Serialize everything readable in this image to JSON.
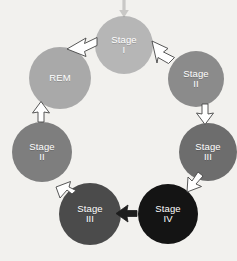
{
  "figure": {
    "name": "sleep-cycle-diagram",
    "background_color": "#f2f1ee",
    "label_color": "#ffffff",
    "arrow_fill": "#ffffff",
    "arrow_stroke": "#3c3c3c"
  },
  "nodes": [
    {
      "id": "stage-1",
      "title": "Stage",
      "numeral": "I",
      "color": "#b6b6b6",
      "cx": 124,
      "cy": 45,
      "r": 29
    },
    {
      "id": "stage-2-right",
      "title": "Stage",
      "numeral": "II",
      "color": "#8b8b8b",
      "cx": 196,
      "cy": 79,
      "r": 28
    },
    {
      "id": "stage-3-right",
      "title": "Stage",
      "numeral": "III",
      "color": "#6d6d6d",
      "cx": 208,
      "cy": 152,
      "r": 29
    },
    {
      "id": "stage-4",
      "title": "Stage",
      "numeral": "IV",
      "color": "#141414",
      "cx": 168,
      "cy": 214,
      "r": 30
    },
    {
      "id": "stage-3-bottom",
      "title": "Stage",
      "numeral": "III",
      "color": "#4b4b4b",
      "cx": 90,
      "cy": 214,
      "r": 31
    },
    {
      "id": "stage-2-left",
      "title": "Stage",
      "numeral": "II",
      "color": "#7e7e7e",
      "cx": 42,
      "cy": 152,
      "r": 30
    },
    {
      "id": "rem",
      "title": "REM",
      "numeral": "",
      "color": "#a9a9a9",
      "cx": 60,
      "cy": 78,
      "r": 31
    }
  ],
  "arrows": [
    {
      "id": "arrow-entry-top",
      "from": "external",
      "to": "stage-1",
      "direction": "down"
    },
    {
      "id": "arrow-rem-to-stage1",
      "from": "rem",
      "to": "stage-1",
      "direction": "up-right"
    },
    {
      "id": "arrow-stage1-to-stage2",
      "from": "stage-1",
      "to": "stage-2-right",
      "direction": "down-right"
    },
    {
      "id": "arrow-stage2-to-stage3",
      "from": "stage-2-right",
      "to": "stage-3-right",
      "direction": "down"
    },
    {
      "id": "arrow-stage3-to-stage4",
      "from": "stage-3-right",
      "to": "stage-4",
      "direction": "down-left"
    },
    {
      "id": "arrow-stage4-to-stage3",
      "from": "stage-4",
      "to": "stage-3-bottom",
      "direction": "left"
    },
    {
      "id": "arrow-stage3-to-stage2",
      "from": "stage-3-bottom",
      "to": "stage-2-left",
      "direction": "up-left"
    },
    {
      "id": "arrow-stage2-to-rem",
      "from": "stage-2-left",
      "to": "rem",
      "direction": "up"
    }
  ]
}
